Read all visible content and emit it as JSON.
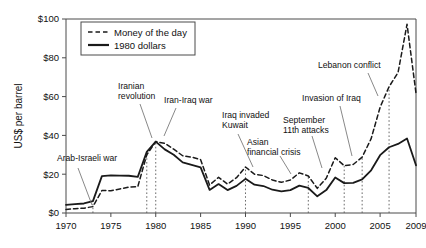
{
  "chart_data": {
    "type": "line",
    "title": "",
    "xlabel": "",
    "ylabel": "US$ per barrel",
    "xlim": [
      1970,
      2009
    ],
    "ylim": [
      0,
      100
    ],
    "grid": false,
    "legend_position": "top-left",
    "x_ticks": [
      "1970",
      "1975",
      "1980",
      "1985",
      "1990",
      "1995",
      "2000",
      "2005",
      "2009"
    ],
    "x_tick_values": [
      1970,
      1975,
      1980,
      1985,
      1990,
      1995,
      2000,
      2005,
      2009
    ],
    "y_ticks": [
      "$0",
      "$20",
      "$40",
      "$60",
      "$80",
      "$100"
    ],
    "y_tick_values": [
      0,
      20,
      40,
      60,
      80,
      100
    ],
    "x": [
      1970,
      1971,
      1972,
      1973,
      1974,
      1975,
      1976,
      1977,
      1978,
      1979,
      1980,
      1981,
      1982,
      1983,
      1984,
      1985,
      1986,
      1987,
      1988,
      1989,
      1990,
      1991,
      1992,
      1993,
      1994,
      1995,
      1996,
      1997,
      1998,
      1999,
      2000,
      2001,
      2002,
      2003,
      2004,
      2005,
      2006,
      2007,
      2008,
      2009
    ],
    "series": [
      {
        "name": "Money of the day",
        "style": "dashed",
        "color": "#1a1a1a",
        "values": [
          1.8,
          2.2,
          2.5,
          3.3,
          11.6,
          11.5,
          12.4,
          13.3,
          13.6,
          30.0,
          36.8,
          35.9,
          32.9,
          29.5,
          28.8,
          27.5,
          14.4,
          18.4,
          14.9,
          18.2,
          23.7,
          20.0,
          19.3,
          17.0,
          15.8,
          17.0,
          20.7,
          19.1,
          12.7,
          17.9,
          28.5,
          24.4,
          25.0,
          28.8,
          38.3,
          54.5,
          65.1,
          72.4,
          97.3,
          61.7
        ]
      },
      {
        "name": "1980 dollars",
        "style": "solid",
        "color": "#1a1a1a",
        "values": [
          4.2,
          4.6,
          4.9,
          6.1,
          19.0,
          19.4,
          19.3,
          19.2,
          18.6,
          31.5,
          36.8,
          32.8,
          30.0,
          26.1,
          24.8,
          23.5,
          11.9,
          14.9,
          11.8,
          14.0,
          17.6,
          14.6,
          13.9,
          12.0,
          11.1,
          11.8,
          14.1,
          12.9,
          8.6,
          11.8,
          18.3,
          15.4,
          15.5,
          17.3,
          22.0,
          29.8,
          33.9,
          35.6,
          38.4,
          24.6
        ]
      }
    ],
    "annotations": [
      {
        "label": "Arab-Israeli war",
        "year": 1973,
        "text_x": 57,
        "text_y": 161,
        "lines": [
          "Arab-Israeli war"
        ],
        "leader_from": [
          78,
          168
        ],
        "leader_to": [
          92,
          205
        ]
      },
      {
        "label": "Iranian revolution",
        "year": 1979,
        "text_x": 118,
        "text_y": 89,
        "lines": [
          "Iranian",
          "revolution"
        ],
        "leader_from": [
          140,
          104
        ],
        "leader_to": [
          152,
          138
        ]
      },
      {
        "label": "Iran-Iraq war",
        "year": 1980,
        "text_x": 164,
        "text_y": 103,
        "lines": [
          "Iran-Iraq war"
        ],
        "leader_from": [
          176,
          108
        ],
        "leader_to": [
          164,
          136
        ]
      },
      {
        "label": "Iraq invaded Kuwait",
        "year": 1990,
        "text_x": 222,
        "text_y": 118,
        "lines": [
          "Iraq invaded",
          "Kuwait"
        ],
        "leader_from": [
          238,
          134
        ],
        "leader_to": [
          253,
          167
        ]
      },
      {
        "label": "Asian financial crisis",
        "year": 1997,
        "text_x": 247,
        "text_y": 145,
        "lines": [
          "Asian",
          "financial crisis"
        ],
        "leader_from": [
          280,
          156
        ],
        "leader_to": [
          291,
          174
        ]
      },
      {
        "label": "September 11th attacks",
        "year": 2001,
        "text_x": 283,
        "text_y": 123,
        "lines": [
          "September",
          "11th attacks"
        ],
        "leader_from": [
          312,
          136
        ],
        "leader_to": [
          322,
          168
        ]
      },
      {
        "label": "Invasion of Iraq",
        "year": 2003,
        "text_x": 302,
        "text_y": 101,
        "lines": [
          "Invasion of Iraq"
        ],
        "leader_from": [
          340,
          106
        ],
        "leader_to": [
          352,
          156
        ]
      },
      {
        "label": "Lebanon conflict",
        "year": 2006,
        "text_x": 318,
        "text_y": 68,
        "lines": [
          "Lebanon conflict"
        ],
        "leader_from": [
          368,
          73
        ],
        "leader_to": [
          378,
          96
        ]
      }
    ],
    "event_marker_years": [
      1973,
      1979,
      1980,
      1990,
      1997,
      2001,
      2003,
      2006
    ]
  }
}
